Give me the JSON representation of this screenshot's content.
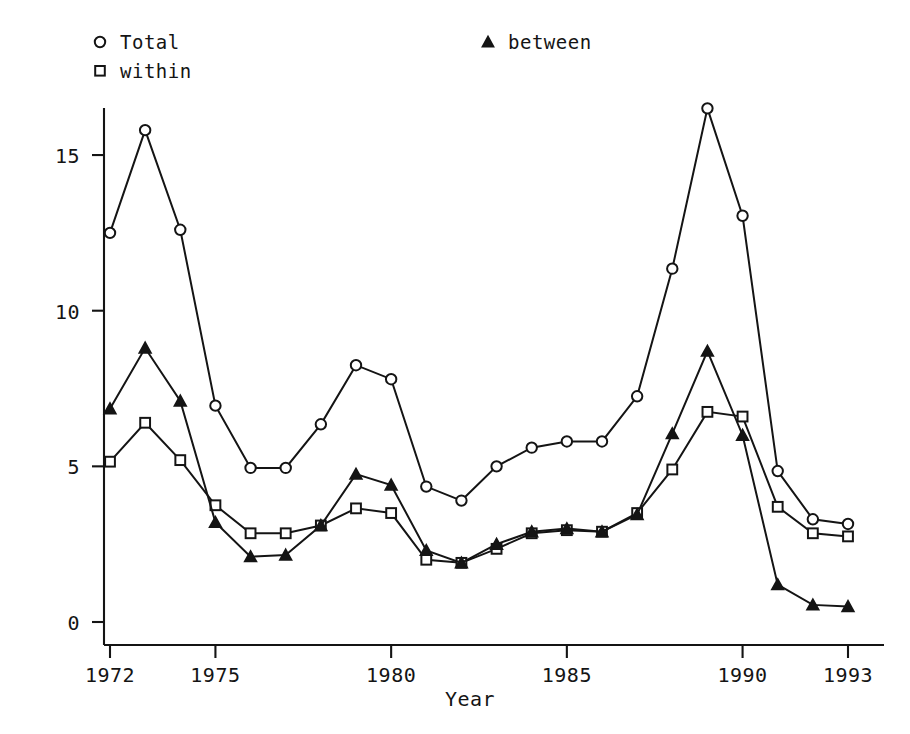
{
  "chart_data": {
    "type": "line",
    "title": "",
    "xlabel": "Year",
    "ylabel": "",
    "grid": false,
    "legend_position": "top",
    "xlim": [
      1972,
      1993
    ],
    "ylim": [
      0,
      16.8
    ],
    "x": [
      1972,
      1973,
      1974,
      1975,
      1976,
      1977,
      1978,
      1979,
      1980,
      1981,
      1982,
      1983,
      1984,
      1985,
      1986,
      1987,
      1988,
      1989,
      1990,
      1991,
      1992,
      1993
    ],
    "xticks": [
      1972,
      1975,
      1980,
      1985,
      1990,
      1993
    ],
    "xticklabels": [
      "1972",
      "1975",
      "1980",
      "1985",
      "1990",
      "1993"
    ],
    "yticks": [
      0,
      5,
      10,
      15
    ],
    "yticklabels": [
      "0",
      "5",
      "10",
      "15"
    ],
    "series": [
      {
        "name": "Total",
        "marker": "circle-open",
        "values": [
          12.5,
          15.8,
          12.6,
          6.95,
          4.95,
          4.95,
          6.35,
          8.25,
          7.8,
          4.35,
          3.9,
          5.0,
          5.6,
          5.8,
          5.8,
          7.25,
          11.35,
          16.5,
          13.05,
          4.85,
          3.3,
          3.15
        ]
      },
      {
        "name": "within",
        "marker": "square-open",
        "values": [
          5.15,
          6.4,
          5.2,
          3.75,
          2.85,
          2.85,
          3.1,
          3.65,
          3.5,
          2.0,
          1.9,
          2.35,
          2.85,
          2.95,
          2.9,
          3.5,
          4.9,
          6.75,
          6.6,
          3.7,
          2.85,
          2.75
        ]
      },
      {
        "name": "between",
        "marker": "triangle-solid",
        "values": [
          6.85,
          8.8,
          7.1,
          3.2,
          2.1,
          2.15,
          3.1,
          4.75,
          4.4,
          2.3,
          1.9,
          2.5,
          2.9,
          3.0,
          2.9,
          3.45,
          6.05,
          8.7,
          6.0,
          1.2,
          0.55,
          0.5
        ]
      }
    ]
  },
  "legend": {
    "entries": [
      {
        "label": "Total",
        "marker": "circle-open"
      },
      {
        "label": "within",
        "marker": "square-open"
      },
      {
        "label": "between",
        "marker": "triangle-solid"
      }
    ]
  },
  "axes": {
    "x_title": "Year"
  },
  "colors": {
    "ink": "#141414",
    "background": "#ffffff"
  }
}
